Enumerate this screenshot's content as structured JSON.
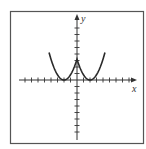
{
  "chart_data": {
    "type": "line",
    "title": "",
    "xlabel": "x",
    "ylabel": "y",
    "xlim": [
      -9,
      9
    ],
    "ylim": [
      -9,
      9
    ],
    "grid": false,
    "tick_step": 1,
    "legend": null,
    "series": [
      {
        "name": "curve",
        "equation": "y = (|x| - 2)^2 (approx.)",
        "x": [
          -4.3,
          -4,
          -3.5,
          -3,
          -2.5,
          -2,
          -1.5,
          -1,
          -0.5,
          0,
          0.5,
          1,
          1.5,
          2,
          2.5,
          3,
          3.5,
          4,
          4.3
        ],
        "y": [
          3.3,
          2.9,
          2.0,
          1.2,
          0.3,
          0,
          0.3,
          1.2,
          2.0,
          3.2,
          2.0,
          1.2,
          0.3,
          0,
          0.3,
          1.2,
          2.0,
          2.9,
          3.3
        ],
        "color": "#2a2a2a"
      }
    ],
    "annotations": [
      "Cusp/local max at (0, ~3.2)",
      "Minima at x = -2 and x = 2"
    ]
  },
  "labels": {
    "x": "x",
    "y": "y"
  },
  "colors": {
    "frame": "#555555",
    "axis": "#333333",
    "curve": "#2a2a2a"
  }
}
